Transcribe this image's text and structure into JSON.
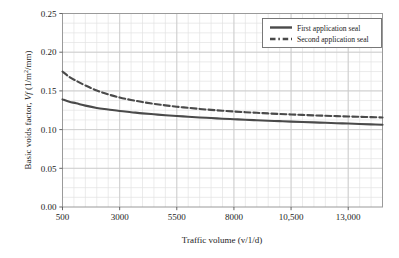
{
  "chart_data": {
    "type": "line",
    "title": "",
    "xlabel": "Traffic volume (v/1/d)",
    "ylabel_prefix": "Basic voids factor, ",
    "ylabel_symbol": "Vf",
    "ylabel_units": " (1/m",
    "ylabel_units_sup": "2",
    "ylabel_units_tail": "/mm)",
    "ylabel_full": "Basic voids factor, Vf (1/m2/mm)",
    "xlim": [
      500,
      14500
    ],
    "ylim": [
      0.0,
      0.25
    ],
    "xticks": [
      500,
      3000,
      5500,
      8000,
      10500,
      13000
    ],
    "xtick_labels": [
      "500",
      "3000",
      "5500",
      "8000",
      "10,500",
      "13,000"
    ],
    "yticks": [
      0.0,
      0.05,
      0.1,
      0.15,
      0.2,
      0.25
    ],
    "ytick_labels": [
      "0.00",
      "0.05",
      "0.10",
      "0.15",
      "0.20",
      "0.25"
    ],
    "grid": true,
    "grid_minor": true,
    "minor_x_step": 500,
    "minor_y_step": 0.0125,
    "legend_position": "top-right",
    "series": [
      {
        "name": "First application seal",
        "style": "solid",
        "color": "#4a4a4a",
        "x": [
          500,
          800,
          1100,
          1500,
          2000,
          2500,
          3000,
          3500,
          4000,
          4500,
          5000,
          5500,
          6000,
          6500,
          7000,
          7500,
          8000,
          8500,
          9000,
          9500,
          10000,
          10500,
          11000,
          11500,
          12000,
          12500,
          13000,
          13500,
          14000,
          14500
        ],
        "y": [
          0.139,
          0.136,
          0.134,
          0.131,
          0.128,
          0.126,
          0.124,
          0.1225,
          0.121,
          0.1198,
          0.1186,
          0.1176,
          0.1166,
          0.1157,
          0.1149,
          0.1141,
          0.1134,
          0.1127,
          0.1121,
          0.1115,
          0.1109,
          0.1103,
          0.1098,
          0.1093,
          0.1088,
          0.1083,
          0.1078,
          0.1073,
          0.1068,
          0.1063
        ]
      },
      {
        "name": "Second application seal",
        "style": "dashed",
        "color": "#4a4a4a",
        "x": [
          500,
          800,
          1100,
          1500,
          2000,
          2500,
          3000,
          3500,
          4000,
          4500,
          5000,
          5500,
          6000,
          6500,
          7000,
          7500,
          8000,
          8500,
          9000,
          9500,
          10000,
          10500,
          11000,
          11500,
          12000,
          12500,
          13000,
          13500,
          14000,
          14500
        ],
        "y": [
          0.175,
          0.168,
          0.163,
          0.157,
          0.1505,
          0.1455,
          0.1415,
          0.1383,
          0.1356,
          0.1333,
          0.1313,
          0.1296,
          0.1281,
          0.1267,
          0.1255,
          0.1244,
          0.1234,
          0.1225,
          0.1217,
          0.1209,
          0.1202,
          0.1196,
          0.119,
          0.1184,
          0.1179,
          0.1174,
          0.1169,
          0.1165,
          0.1161,
          0.1157
        ]
      }
    ]
  },
  "legend": {
    "items": [
      {
        "label": "First application seal",
        "style": "solid"
      },
      {
        "label": "Second application seal",
        "style": "dashed"
      }
    ]
  },
  "axes": {
    "x_title": "Traffic volume (v/1/d)",
    "y_title": "Basic voids factor, Vf (1/m2/mm)"
  },
  "colors": {
    "line": "#4a4a4a",
    "grid_major": "#c9c9c9",
    "grid_minor": "#e3e3e3",
    "frame": "#9a9a9a",
    "text": "#1c1c1c",
    "background": "#ffffff"
  }
}
